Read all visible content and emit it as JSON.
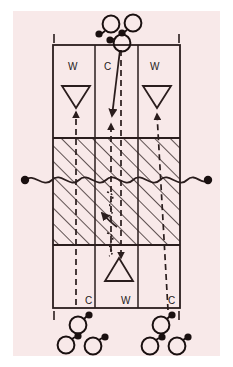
{
  "diagram": {
    "background_color": "#f8e9e9",
    "page_color": "#ffffff",
    "line_color": "#2a1d1d",
    "marker_color": "#1a1010",
    "court": {
      "x": 53,
      "y": 45,
      "width": 127,
      "height": 263,
      "zone_line_x": [
        95,
        138
      ],
      "attack_line_y": [
        138,
        245
      ],
      "net_y": 180
    },
    "corner_ticks": [
      {
        "name": "tick-top-left",
        "x": 54,
        "y": 34,
        "h": 9
      },
      {
        "name": "tick-top-right",
        "x": 179,
        "y": 34,
        "h": 9
      },
      {
        "name": "tick-bottom-left",
        "x": 54,
        "y": 311,
        "h": 9
      },
      {
        "name": "tick-bottom-right",
        "x": 179,
        "y": 311,
        "h": 9
      }
    ],
    "zone_labels_top": [
      {
        "text": "W",
        "x": 68,
        "y": 68
      },
      {
        "text": "C",
        "x": 106,
        "y": 68
      },
      {
        "text": "W",
        "x": 152,
        "y": 68
      }
    ],
    "zone_labels_bottom": [
      {
        "text": "C",
        "x": 88,
        "y": 303
      },
      {
        "text": "W",
        "x": 124,
        "y": 303
      },
      {
        "text": "C",
        "x": 171,
        "y": 303
      }
    ],
    "players_on_court": [
      {
        "name": "player-top-left-wing",
        "shape": "triangle-down",
        "cx": 76,
        "cy": 97
      },
      {
        "name": "player-top-right-wing",
        "shape": "triangle-down",
        "cx": 157,
        "cy": 97
      },
      {
        "name": "player-bottom-center",
        "shape": "triangle-up",
        "cx": 119,
        "cy": 269
      }
    ],
    "queue_top": [
      {
        "name": "waiting-player-top-1",
        "cx": 111,
        "cy": 24,
        "ball_cx": 100,
        "ball_cy": 33
      },
      {
        "name": "waiting-player-top-2",
        "cx": 133,
        "cy": 23,
        "ball_cx": 122,
        "ball_cy": 33
      },
      {
        "name": "waiting-player-top-3",
        "cx": 122,
        "cy": 43,
        "ball_cx": 110,
        "ball_cy": 40
      }
    ],
    "queue_bottom_left": [
      {
        "name": "waiting-player-bl-1",
        "cx": 78,
        "cy": 324,
        "ball_cx": 88,
        "ball_cy": 315
      },
      {
        "name": "waiting-player-bl-2",
        "cx": 66,
        "cy": 344,
        "ball_cx": 77,
        "ball_cy": 336
      },
      {
        "name": "waiting-player-bl-3",
        "cx": 92,
        "cy": 345,
        "ball_cx": 103,
        "ball_cy": 337
      }
    ],
    "queue_bottom_right": [
      {
        "name": "waiting-player-br-1",
        "cx": 161,
        "cy": 324,
        "ball_cx": 171,
        "ball_cy": 315
      },
      {
        "name": "waiting-player-br-2",
        "cx": 150,
        "cy": 345,
        "ball_cx": 160,
        "ball_cy": 337
      },
      {
        "name": "waiting-player-br-3",
        "cx": 176,
        "cy": 345,
        "ball_cx": 187,
        "ball_cy": 337
      }
    ],
    "net": {
      "name": "net-line",
      "y": 180,
      "left_post_x": 25,
      "right_post_x": 208,
      "post_radius": 4
    },
    "ball_path_solid": {
      "name": "serve-ball-path",
      "from_x": 120,
      "from_y": 48,
      "to_x": 112,
      "to_y": 116
    },
    "movement_paths_dashed": [
      {
        "name": "run-path-left-wing",
        "points": "76,305 76,112"
      },
      {
        "name": "run-path-center-up",
        "points": "111,250 111,124"
      },
      {
        "name": "run-path-right-wing",
        "points": "167,310 158,118"
      },
      {
        "name": "run-path-center-down",
        "points": "121,50 121,258"
      }
    ],
    "spin_marks": [
      {
        "name": "ball-spin-mark-upper",
        "cx": 110,
        "cy": 199
      },
      {
        "name": "ball-spin-mark-lower",
        "cx": 110,
        "cy": 240
      }
    ],
    "extra_arrow": {
      "name": "recover-arrow",
      "from_x": 116,
      "from_y": 225,
      "to_x": 102,
      "to_y": 213
    }
  }
}
